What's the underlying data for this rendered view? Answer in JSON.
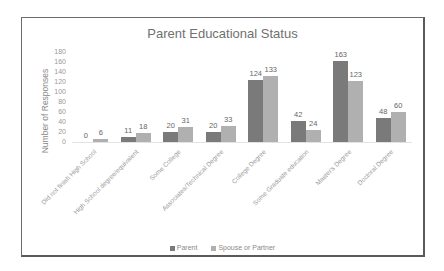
{
  "chart_data": {
    "type": "bar",
    "title": "Parent Educational Status",
    "xlabel": "",
    "ylabel": "Number of Responses",
    "ylim": [
      0,
      180
    ],
    "yticks": [
      0,
      20,
      40,
      60,
      80,
      100,
      120,
      140,
      160,
      180
    ],
    "grid": false,
    "legend_position": "bottom",
    "categories": [
      "Did not finish High School",
      "High School degree/equivalent",
      "Some College",
      "Associates/Technical Degree",
      "College Degree",
      "Some Graduate education",
      "Master's Degree",
      "Doctoral Degree"
    ],
    "series": [
      {
        "name": "Parent",
        "color": "#7a7a7a",
        "values": [
          0,
          11,
          20,
          20,
          124,
          42,
          163,
          48
        ]
      },
      {
        "name": "Spouse or Partner",
        "color": "#b0b0b0",
        "values": [
          6,
          18,
          31,
          33,
          133,
          24,
          123,
          60
        ]
      }
    ]
  },
  "colors": {
    "frame": "#6b6b6b",
    "text": "#707070"
  }
}
